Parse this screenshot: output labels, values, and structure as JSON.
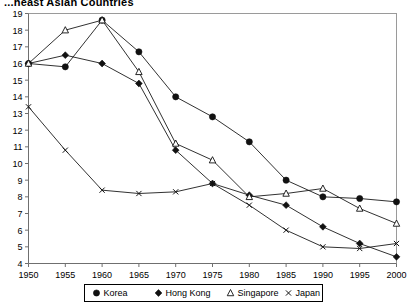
{
  "chart_data": {
    "type": "line",
    "title": "...heast Asian Countries",
    "xlabel": "",
    "ylabel": "",
    "x": [
      1950,
      1955,
      1960,
      1965,
      1970,
      1975,
      1980,
      1985,
      1990,
      1995,
      2000
    ],
    "xlim": [
      1950,
      2000
    ],
    "ylim": [
      4,
      19
    ],
    "xticks": [
      "1950",
      "1955",
      "1960",
      "1965",
      "1970",
      "1975",
      "1980",
      "1985",
      "1990",
      "1995",
      "2000"
    ],
    "yticks": [
      "19",
      "18",
      "17",
      "16",
      "15",
      "14",
      "13",
      "12",
      "11",
      "10",
      "9",
      "8",
      "7",
      "6",
      "5",
      "4"
    ],
    "grid": false,
    "legend_position": "bottom",
    "series": [
      {
        "name": "Korea",
        "marker": "filled-circle",
        "values": [
          16.0,
          15.8,
          18.6,
          16.7,
          14.0,
          12.8,
          11.3,
          9.0,
          8.0,
          7.9,
          7.7
        ]
      },
      {
        "name": "Hong Kong",
        "marker": "filled-diamond",
        "values": [
          16.0,
          16.5,
          16.0,
          14.8,
          10.8,
          8.8,
          8.1,
          7.5,
          6.2,
          5.2,
          4.4
        ]
      },
      {
        "name": "Singapore",
        "marker": "open-triangle",
        "values": [
          16.0,
          18.0,
          18.6,
          15.5,
          11.2,
          10.2,
          8.0,
          8.2,
          8.5,
          7.3,
          6.4
        ]
      },
      {
        "name": "Japan",
        "marker": "cross",
        "values": [
          13.4,
          10.8,
          8.4,
          8.2,
          8.3,
          8.8,
          7.5,
          6.0,
          5.0,
          4.9,
          5.2
        ]
      }
    ]
  },
  "legend": {
    "items": [
      {
        "label": "Korea",
        "marker": "filled-circle"
      },
      {
        "label": "Hong Kong",
        "marker": "filled-diamond"
      },
      {
        "label": "Singapore",
        "marker": "open-triangle"
      },
      {
        "label": "Japan",
        "marker": "cross"
      }
    ]
  }
}
